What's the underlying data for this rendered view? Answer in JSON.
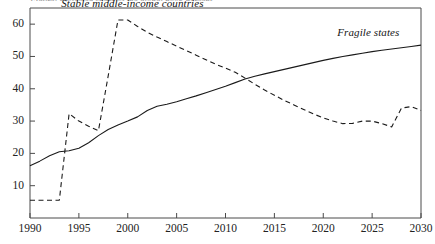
{
  "figure": {
    "clipped_top_text": "Figure: projected share of the global poor, percent",
    "background_color": "#ffffff",
    "ink_color": "#1a1a1a"
  },
  "axes": {
    "y_ticks": [
      "10",
      "20",
      "30",
      "40",
      "50",
      "60"
    ],
    "x_ticks": [
      "1990",
      "1995",
      "2000",
      "2005",
      "2010",
      "2015",
      "2020",
      "2025",
      "2030"
    ]
  },
  "labels": {
    "series_stable": "Stable middle-income countries",
    "series_fragile": "Fragile states"
  },
  "chart_data": {
    "type": "line",
    "title": "",
    "subtitle": "",
    "xlabel": "",
    "ylabel": "",
    "xlim": [
      1990,
      2030
    ],
    "ylim": [
      0,
      65
    ],
    "y_tick_values": [
      10,
      20,
      30,
      40,
      50,
      60
    ],
    "x_tick_values": [
      1990,
      1995,
      2000,
      2005,
      2010,
      2015,
      2020,
      2025,
      2030
    ],
    "grid": false,
    "legend": "inline-annotations",
    "crossing_point": {
      "x": 2012,
      "y": 43.8
    },
    "series": [
      {
        "name": "Fragile states",
        "style": "solid",
        "color": "#1a1a1a",
        "label_position": {
          "x": 2024.5,
          "y": 57.5
        },
        "points": [
          {
            "x": 1990,
            "y": 16.2
          },
          {
            "x": 1991,
            "y": 17.6
          },
          {
            "x": 1992,
            "y": 19.3
          },
          {
            "x": 1993,
            "y": 20.5
          },
          {
            "x": 1994,
            "y": 20.8
          },
          {
            "x": 1995,
            "y": 21.6
          },
          {
            "x": 1996,
            "y": 23.3
          },
          {
            "x": 1997,
            "y": 25.5
          },
          {
            "x": 1998,
            "y": 27.4
          },
          {
            "x": 1999,
            "y": 28.8
          },
          {
            "x": 2000,
            "y": 30.0
          },
          {
            "x": 2001,
            "y": 31.3
          },
          {
            "x": 2002,
            "y": 33.3
          },
          {
            "x": 2003,
            "y": 34.6
          },
          {
            "x": 2004,
            "y": 35.2
          },
          {
            "x": 2005,
            "y": 36.0
          },
          {
            "x": 2006,
            "y": 36.9
          },
          {
            "x": 2007,
            "y": 37.8
          },
          {
            "x": 2008,
            "y": 38.8
          },
          {
            "x": 2009,
            "y": 39.8
          },
          {
            "x": 2010,
            "y": 40.8
          },
          {
            "x": 2011,
            "y": 41.9
          },
          {
            "x": 2012,
            "y": 43.0
          },
          {
            "x": 2013,
            "y": 43.9
          },
          {
            "x": 2014,
            "y": 44.6
          },
          {
            "x": 2015,
            "y": 45.3
          },
          {
            "x": 2016,
            "y": 46.0
          },
          {
            "x": 2017,
            "y": 46.7
          },
          {
            "x": 2018,
            "y": 47.4
          },
          {
            "x": 2019,
            "y": 48.1
          },
          {
            "x": 2020,
            "y": 48.8
          },
          {
            "x": 2021,
            "y": 49.4
          },
          {
            "x": 2022,
            "y": 50.0
          },
          {
            "x": 2023,
            "y": 50.5
          },
          {
            "x": 2024,
            "y": 51.0
          },
          {
            "x": 2025,
            "y": 51.5
          },
          {
            "x": 2026,
            "y": 51.9
          },
          {
            "x": 2027,
            "y": 52.3
          },
          {
            "x": 2028,
            "y": 52.7
          },
          {
            "x": 2029,
            "y": 53.1
          },
          {
            "x": 2030,
            "y": 53.5
          }
        ]
      },
      {
        "name": "Stable middle-income countries",
        "style": "dashed",
        "color": "#1a1a1a",
        "label_position": {
          "x": 1993.2,
          "y": 66.5
        },
        "points": [
          {
            "x": 1990,
            "y": 5.5
          },
          {
            "x": 1991,
            "y": 5.5
          },
          {
            "x": 1992,
            "y": 5.5
          },
          {
            "x": 1993,
            "y": 5.5
          },
          {
            "x": 1994,
            "y": 32.3
          },
          {
            "x": 1995,
            "y": 30.0
          },
          {
            "x": 1996,
            "y": 28.4
          },
          {
            "x": 1997,
            "y": 27.0
          },
          {
            "x": 1998,
            "y": 44.0
          },
          {
            "x": 1999,
            "y": 61.3
          },
          {
            "x": 2000,
            "y": 61.3
          },
          {
            "x": 2001,
            "y": 59.3
          },
          {
            "x": 2002,
            "y": 57.5
          },
          {
            "x": 2003,
            "y": 56.0
          },
          {
            "x": 2004,
            "y": 54.6
          },
          {
            "x": 2005,
            "y": 53.2
          },
          {
            "x": 2006,
            "y": 51.8
          },
          {
            "x": 2007,
            "y": 50.4
          },
          {
            "x": 2008,
            "y": 49.0
          },
          {
            "x": 2009,
            "y": 47.6
          },
          {
            "x": 2010,
            "y": 46.4
          },
          {
            "x": 2011,
            "y": 45.1
          },
          {
            "x": 2012,
            "y": 43.3
          },
          {
            "x": 2013,
            "y": 41.4
          },
          {
            "x": 2014,
            "y": 39.6
          },
          {
            "x": 2015,
            "y": 38.0
          },
          {
            "x": 2016,
            "y": 36.4
          },
          {
            "x": 2017,
            "y": 35.0
          },
          {
            "x": 2018,
            "y": 33.6
          },
          {
            "x": 2019,
            "y": 32.2
          },
          {
            "x": 2020,
            "y": 31.0
          },
          {
            "x": 2021,
            "y": 30.0
          },
          {
            "x": 2022,
            "y": 29.2
          },
          {
            "x": 2023,
            "y": 29.3
          },
          {
            "x": 2024,
            "y": 30.0
          },
          {
            "x": 2025,
            "y": 30.0
          },
          {
            "x": 2026,
            "y": 29.2
          },
          {
            "x": 2027,
            "y": 28.2
          },
          {
            "x": 2028,
            "y": 34.0
          },
          {
            "x": 2029,
            "y": 34.5
          },
          {
            "x": 2030,
            "y": 33.3
          }
        ]
      }
    ]
  }
}
